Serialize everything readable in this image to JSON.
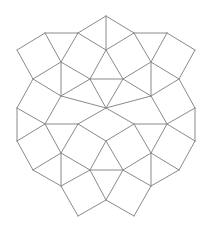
{
  "diagram": {
    "title": "",
    "type": "square-triangle tiling",
    "stroke_color": "#8a8a8a",
    "background": "#ffffff",
    "vertices": {
      "A": [
        106,
        16
      ],
      "E": [
        45,
        33
      ],
      "B": [
        78,
        33
      ],
      "C": [
        134,
        33
      ],
      "F": [
        167,
        33
      ],
      "G": [
        17,
        50
      ],
      "D": [
        106,
        50
      ],
      "H": [
        195,
        50
      ],
      "I": [
        61,
        62
      ],
      "J": [
        151,
        62
      ],
      "K": [
        33,
        79
      ],
      "L": [
        90,
        79
      ],
      "M": [
        123,
        79
      ],
      "N": [
        179,
        79
      ],
      "P": [
        61,
        96
      ],
      "Q": [
        151,
        96
      ],
      "W": [
        17,
        108
      ],
      "R": [
        106,
        108
      ],
      "X": [
        195,
        108
      ],
      "S": [
        45,
        124
      ],
      "S2": [
        78,
        124
      ],
      "T2": [
        134,
        124
      ],
      "T": [
        167,
        124
      ],
      "Y": [
        17,
        141
      ],
      "Z": [
        106,
        141
      ],
      "Y2": [
        195,
        141
      ],
      "U": [
        61,
        153
      ],
      "V": [
        151,
        153
      ],
      "K2": [
        33,
        170
      ],
      "L2": [
        90,
        170
      ],
      "M2": [
        123,
        170
      ],
      "N2": [
        179,
        170
      ],
      "P2": [
        61,
        186
      ],
      "Q2": [
        151,
        186
      ],
      "R2": [
        106,
        200
      ],
      "B2": [
        78,
        216
      ],
      "C2": [
        134,
        216
      ]
    },
    "edges": [
      [
        "A",
        "B"
      ],
      [
        "A",
        "C"
      ],
      [
        "A",
        "D"
      ],
      [
        "B",
        "D"
      ],
      [
        "C",
        "D"
      ],
      [
        "E",
        "B"
      ],
      [
        "C",
        "F"
      ],
      [
        "E",
        "G"
      ],
      [
        "F",
        "H"
      ],
      [
        "E",
        "I"
      ],
      [
        "B",
        "I"
      ],
      [
        "F",
        "J"
      ],
      [
        "C",
        "J"
      ],
      [
        "G",
        "K"
      ],
      [
        "H",
        "N"
      ],
      [
        "I",
        "K"
      ],
      [
        "J",
        "N"
      ],
      [
        "I",
        "L"
      ],
      [
        "J",
        "M"
      ],
      [
        "D",
        "L"
      ],
      [
        "D",
        "M"
      ],
      [
        "L",
        "M"
      ],
      [
        "I",
        "P"
      ],
      [
        "J",
        "Q"
      ],
      [
        "K",
        "P"
      ],
      [
        "N",
        "Q"
      ],
      [
        "L",
        "P"
      ],
      [
        "M",
        "Q"
      ],
      [
        "L",
        "R"
      ],
      [
        "M",
        "R"
      ],
      [
        "P",
        "R"
      ],
      [
        "Q",
        "R"
      ],
      [
        "K",
        "W"
      ],
      [
        "N",
        "X"
      ],
      [
        "P",
        "S"
      ],
      [
        "Q",
        "T"
      ],
      [
        "W",
        "S"
      ],
      [
        "X",
        "T"
      ],
      [
        "R",
        "S2"
      ],
      [
        "R",
        "T2"
      ],
      [
        "S",
        "S2"
      ],
      [
        "T2",
        "T"
      ],
      [
        "W",
        "Y"
      ],
      [
        "X",
        "Y2"
      ],
      [
        "S",
        "Y"
      ],
      [
        "T",
        "Y2"
      ],
      [
        "S",
        "U"
      ],
      [
        "S2",
        "U"
      ],
      [
        "T2",
        "V"
      ],
      [
        "T",
        "V"
      ],
      [
        "S2",
        "Z"
      ],
      [
        "T2",
        "Z"
      ],
      [
        "Y",
        "K2"
      ],
      [
        "Y2",
        "N2"
      ],
      [
        "U",
        "K2"
      ],
      [
        "V",
        "N2"
      ],
      [
        "U",
        "P2"
      ],
      [
        "V",
        "Q2"
      ],
      [
        "U",
        "L2"
      ],
      [
        "V",
        "M2"
      ],
      [
        "K2",
        "P2"
      ],
      [
        "N2",
        "Q2"
      ],
      [
        "L2",
        "P2"
      ],
      [
        "M2",
        "Q2"
      ],
      [
        "L2",
        "M2"
      ],
      [
        "L2",
        "Z"
      ],
      [
        "M2",
        "Z"
      ],
      [
        "L2",
        "R2"
      ],
      [
        "M2",
        "R2"
      ],
      [
        "P2",
        "B2"
      ],
      [
        "Q2",
        "C2"
      ],
      [
        "R2",
        "B2"
      ],
      [
        "R2",
        "C2"
      ]
    ]
  }
}
